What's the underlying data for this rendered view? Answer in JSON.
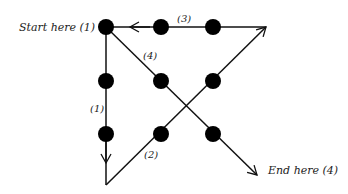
{
  "diagram": {
    "labels": {
      "start": "Start here (1)",
      "end": "End here (4)",
      "seg1": "(1)",
      "seg2": "(2)",
      "seg3": "(3)",
      "seg4": "(4)"
    },
    "dots": [
      {
        "row": 1,
        "col": 1
      },
      {
        "row": 1,
        "col": 2
      },
      {
        "row": 1,
        "col": 3
      },
      {
        "row": 2,
        "col": 1
      },
      {
        "row": 2,
        "col": 2
      },
      {
        "row": 2,
        "col": 3
      },
      {
        "row": 3,
        "col": 1
      },
      {
        "row": 3,
        "col": 2
      },
      {
        "row": 3,
        "col": 3
      }
    ],
    "colors": {
      "line": "#111111",
      "dot": "#000000",
      "text": "#222222"
    }
  }
}
